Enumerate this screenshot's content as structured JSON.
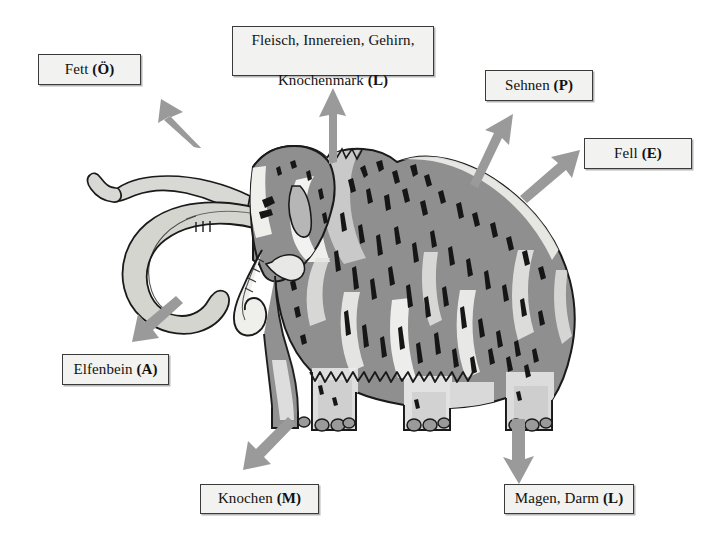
{
  "figure": {
    "colors": {
      "outline": "#1a1a1a",
      "fur_mid_gray": "#8f8f8f",
      "fur_light_gray": "#c9c9c9",
      "fur_highlight": "#f4f4f2",
      "fur_dark_marks": "#161616",
      "tusk_light": "#d8d8d4",
      "tusk_shade": "#b4b4ae",
      "arrow_gray": "#9a9a9a",
      "background": "#ffffff",
      "box_fill": "#f2f2f0",
      "box_border": "#3a3a3a"
    }
  },
  "labels": [
    {
      "id": "fett",
      "text": "Fett (Ö)",
      "plain": "Fett",
      "code": "Ö",
      "lines": [
        "Fett (Ö)"
      ],
      "position": "top-left"
    },
    {
      "id": "fleisch",
      "text": "Fleisch, Innereien, Gehirn, Knochenmark (L)",
      "plain": "Fleisch, Innereien, Gehirn, Knochenmark",
      "code": "L",
      "lines": [
        "Fleisch, Innereien, Gehirn,",
        "Knochenmark (L)"
      ],
      "position": "top-center"
    },
    {
      "id": "sehnen",
      "text": "Sehnen (P)",
      "plain": "Sehnen",
      "code": "P",
      "lines": [
        "Sehnen (P)"
      ],
      "position": "top-right"
    },
    {
      "id": "fell",
      "text": "Fell (E)",
      "plain": "Fell",
      "code": "E",
      "lines": [
        "Fell (E)"
      ],
      "position": "right"
    },
    {
      "id": "elfenbein",
      "text": "Elfenbein (A)",
      "plain": "Elfenbein",
      "code": "A",
      "lines": [
        "Elfenbein (A)"
      ],
      "position": "left"
    },
    {
      "id": "knochen",
      "text": "Knochen (M)",
      "plain": "Knochen",
      "code": "M",
      "lines": [
        "Knochen (M)"
      ],
      "position": "bottom-left"
    },
    {
      "id": "magen",
      "text": "Magen, Darm (L)",
      "plain": "Magen, Darm",
      "code": "L",
      "lines": [
        "Magen, Darm (L)"
      ],
      "position": "bottom-right"
    }
  ],
  "arrows": [
    {
      "id": "arrow-fett",
      "points_to": "fett",
      "direction": "up-left"
    },
    {
      "id": "arrow-fleisch",
      "points_to": "fleisch",
      "direction": "up"
    },
    {
      "id": "arrow-sehnen",
      "points_to": "sehnen",
      "direction": "up-right-steep"
    },
    {
      "id": "arrow-fell",
      "points_to": "fell",
      "direction": "up-right-shallow"
    },
    {
      "id": "arrow-elfenbein",
      "points_to": "elfenbein",
      "direction": "down-left"
    },
    {
      "id": "arrow-knochen",
      "points_to": "knochen",
      "direction": "down-left"
    },
    {
      "id": "arrow-magen",
      "points_to": "magen",
      "direction": "down"
    }
  ]
}
